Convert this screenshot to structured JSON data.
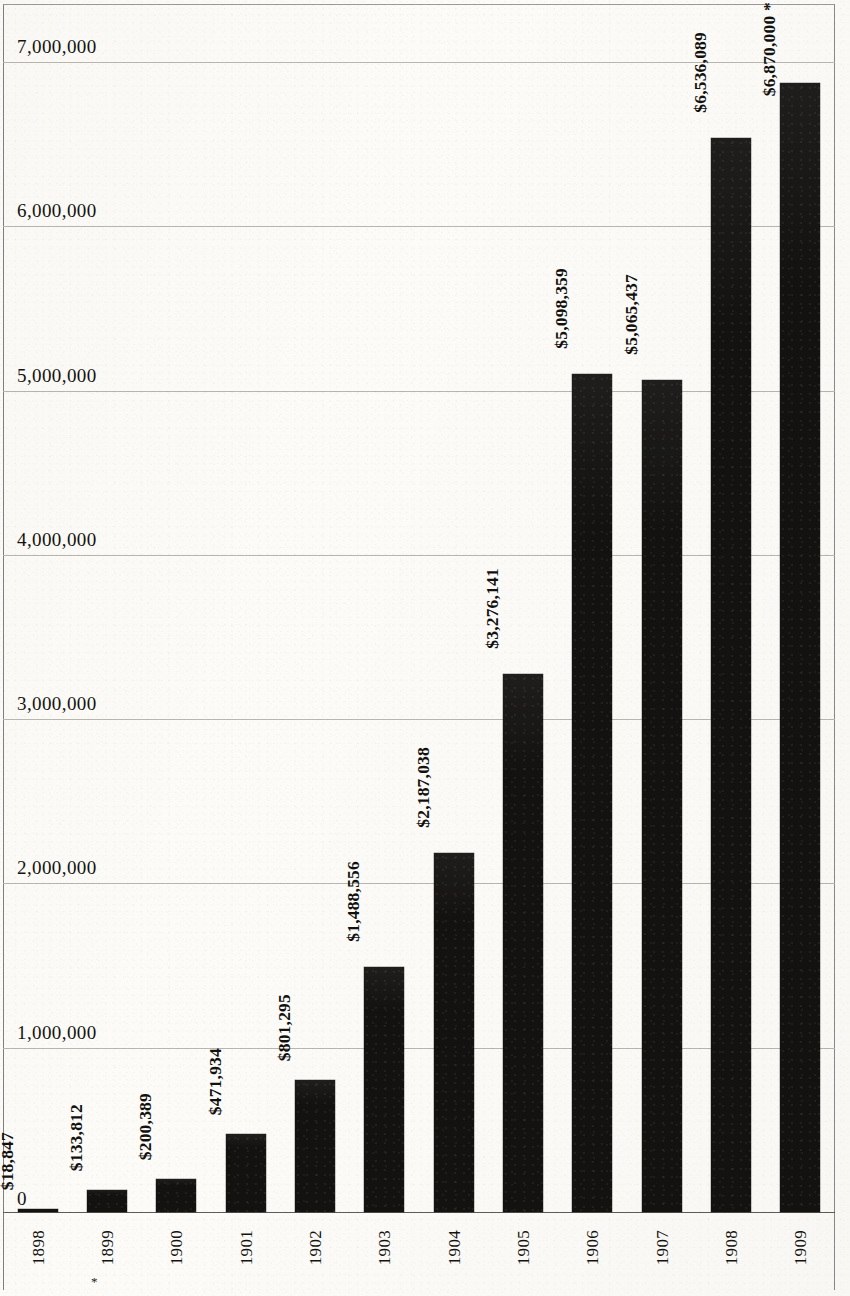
{
  "chart_data": {
    "type": "bar",
    "title": "",
    "subtitle": "",
    "xlabel": "",
    "ylabel": "",
    "categories": [
      "1898",
      "1899",
      "1900",
      "1901",
      "1902",
      "1903",
      "1904",
      "1905",
      "1906",
      "1907",
      "1908",
      "1909"
    ],
    "values": [
      18847,
      133812,
      200389,
      471934,
      801295,
      1488556,
      2187038,
      3276141,
      5098359,
      5065437,
      6536089,
      6870000
    ],
    "value_labels": [
      "$18,847",
      "$133,812",
      "$200,389",
      "$471,934",
      "$801,295",
      "$1,488,556",
      "$2,187,038",
      "$3,276,141",
      "$5,098,359",
      "$5,065,437",
      "$6,536,089",
      "$6,870,000 *"
    ],
    "ylim": [
      0,
      7000000
    ],
    "ytick_values": [
      0,
      1000000,
      2000000,
      3000000,
      4000000,
      5000000,
      6000000,
      7000000
    ],
    "ytick_labels": [
      "0",
      "1,000,000",
      "2,000,000",
      "3,000,000",
      "4,000,000",
      "5,000,000",
      "6,000,000",
      "7,000,000"
    ],
    "grid": true,
    "legend": null,
    "legend_position": "none",
    "annotations": [
      {
        "text": "*",
        "near": "1899",
        "position": "below-x-tick"
      },
      {
        "text": "*",
        "near": "1909",
        "position": "value-label-suffix"
      }
    ],
    "bar_color": "#131211",
    "grid_color": "#b9b6b0",
    "axis_color": "#5e5c58",
    "background_color": "#fcfbf8"
  },
  "axis": {
    "baseline_label": "0"
  }
}
